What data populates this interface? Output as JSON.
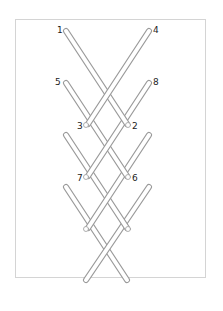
{
  "diagram": {
    "type": "lacing-pattern",
    "stick_color": "#ffffff",
    "stick_outline": "#9a9a9a",
    "frame_color": "#d4d4d4",
    "labels": [
      {
        "id": "1",
        "text": "1",
        "x": 57,
        "y": 26
      },
      {
        "id": "4",
        "text": "4",
        "x": 153,
        "y": 26
      },
      {
        "id": "5",
        "text": "5",
        "x": 55,
        "y": 78
      },
      {
        "id": "8",
        "text": "8",
        "x": 153,
        "y": 78
      },
      {
        "id": "3",
        "text": "3",
        "x": 77,
        "y": 122
      },
      {
        "id": "2",
        "text": "2",
        "x": 132,
        "y": 122
      },
      {
        "id": "7",
        "text": "7",
        "x": 77,
        "y": 174
      },
      {
        "id": "6",
        "text": "6",
        "x": 132,
        "y": 174
      }
    ]
  }
}
